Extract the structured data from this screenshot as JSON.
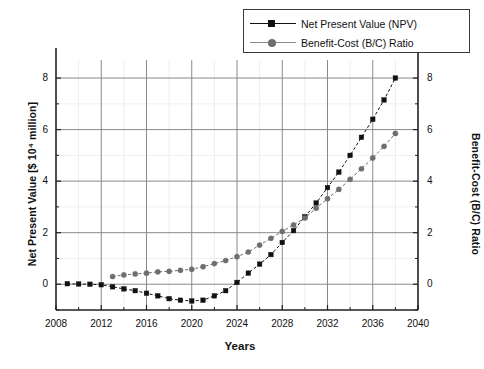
{
  "chart_data": {
    "type": "line",
    "title": "",
    "xlabel": "Years",
    "ylabel": "Net Present Value [$ 10⁴ million]",
    "y2label": "Benefit-Cost (B/C) Ratio",
    "xlim": [
      2008,
      2040
    ],
    "ylim": [
      -1.0,
      8.7
    ],
    "y2lim": [
      -1.0,
      8.7
    ],
    "xticks": [
      2008,
      2012,
      2016,
      2020,
      2024,
      2028,
      2032,
      2036,
      2040
    ],
    "xtick_labels": [
      "2008",
      "2012",
      "2016",
      "2020",
      "2024",
      "2028",
      "2032",
      "2036",
      "2040"
    ],
    "yticks": [
      0,
      2,
      4,
      6,
      8
    ],
    "ytick_labels": [
      "0",
      "2",
      "4",
      "6",
      "8"
    ],
    "y2ticks": [
      0,
      2,
      4,
      6,
      8
    ],
    "y2tick_labels": [
      "0",
      "2",
      "4",
      "6",
      "8"
    ],
    "minor_xticks": [
      2010,
      2014,
      2018,
      2022,
      2026,
      2030,
      2034,
      2038
    ],
    "minor_yticks": [
      -1,
      1,
      3,
      5,
      7
    ],
    "grid": true,
    "legend_position": "top-right",
    "series": [
      {
        "name": "Net Present Value (NPV)",
        "axis": "left",
        "marker": "square",
        "color": "#111111",
        "line_style": "dashed",
        "x": [
          2009,
          2010,
          2011,
          2012,
          2013,
          2014,
          2015,
          2016,
          2017,
          2018,
          2019,
          2020,
          2021,
          2022,
          2023,
          2024,
          2025,
          2026,
          2027,
          2028,
          2029,
          2030,
          2031,
          2032,
          2033,
          2034,
          2035,
          2036,
          2037,
          2038
        ],
        "values": [
          0.02,
          0.01,
          0.0,
          -0.02,
          -0.1,
          -0.18,
          -0.25,
          -0.35,
          -0.45,
          -0.56,
          -0.62,
          -0.65,
          -0.62,
          -0.45,
          -0.25,
          0.07,
          0.43,
          0.78,
          1.15,
          1.62,
          2.08,
          2.62,
          3.15,
          3.75,
          4.35,
          5.0,
          5.7,
          6.4,
          7.15,
          8.0
        ]
      },
      {
        "name": "Benefit-Cost (B/C) Ratio",
        "axis": "right",
        "marker": "circle",
        "color": "#6e6e6e",
        "line_style": "dashed",
        "x": [
          2013,
          2014,
          2015,
          2016,
          2017,
          2018,
          2019,
          2020,
          2021,
          2022,
          2023,
          2024,
          2025,
          2026,
          2027,
          2028,
          2029,
          2030,
          2031,
          2032,
          2033,
          2034,
          2035,
          2036,
          2037,
          2038
        ],
        "values": [
          0.3,
          0.36,
          0.4,
          0.43,
          0.48,
          0.5,
          0.54,
          0.58,
          0.68,
          0.8,
          0.92,
          1.07,
          1.25,
          1.52,
          1.78,
          2.05,
          2.3,
          2.57,
          2.95,
          3.32,
          3.68,
          4.07,
          4.48,
          4.9,
          5.35,
          5.85
        ]
      }
    ]
  },
  "legend": {
    "entries": [
      {
        "label": "Net Present Value (NPV)",
        "marker": "square",
        "color": "#111111"
      },
      {
        "label": "Benefit-Cost (B/C) Ratio",
        "marker": "circle",
        "color": "#6e6e6e"
      }
    ]
  }
}
